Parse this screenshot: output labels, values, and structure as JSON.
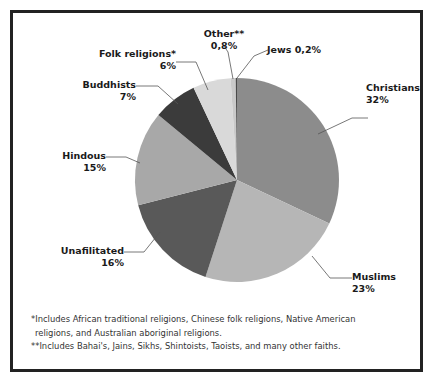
{
  "chart_data": {
    "type": "pie",
    "title": "",
    "subtitle": "",
    "xlabel": "",
    "ylabel": "",
    "legend_position": "none",
    "grid": false,
    "labels_outside": true,
    "start_angle_deg": 0,
    "direction": "clockwise",
    "categories": [
      "Christians",
      "Muslims",
      "Unafilitated",
      "Hindous",
      "Buddhists",
      "Folk religions*",
      "Other**",
      "Jews"
    ],
    "values": [
      32,
      23,
      16,
      15,
      7,
      6,
      0.8,
      0.2
    ],
    "value_labels": [
      "32%",
      "23%",
      "16%",
      "15%",
      "7%",
      "6%",
      "0,8%",
      "0,2%"
    ],
    "colors": [
      "#8c8c8c",
      "#b6b6b6",
      "#595959",
      "#a8a8a8",
      "#3b3b3b",
      "#d9d9d9",
      "#c9c9c9",
      "#4a4a4a"
    ],
    "slices": [
      {
        "name": "Christians",
        "value": 32,
        "value_label": "32%",
        "color": "#8c8c8c",
        "label_name": "Christians",
        "label_value": "32%"
      },
      {
        "name": "Muslims",
        "value": 23,
        "value_label": "23%",
        "color": "#b6b6b6",
        "label_name": "Muslims",
        "label_value": "23%"
      },
      {
        "name": "Unafilitated",
        "value": 16,
        "value_label": "16%",
        "color": "#595959",
        "label_name": "Unafilitated",
        "label_value": "16%"
      },
      {
        "name": "Hindous",
        "value": 15,
        "value_label": "15%",
        "color": "#a8a8a8",
        "label_name": "Hindous",
        "label_value": "15%"
      },
      {
        "name": "Buddhists",
        "value": 7,
        "value_label": "7%",
        "color": "#3b3b3b",
        "label_name": "Buddhists",
        "label_value": "7%"
      },
      {
        "name": "Folk religions*",
        "value": 6,
        "value_label": "6%",
        "color": "#d9d9d9",
        "label_name": "Folk religions*",
        "label_value": "6%"
      },
      {
        "name": "Other**",
        "value": 0.8,
        "value_label": "0,8%",
        "color": "#c9c9c9",
        "label_name": "Other**",
        "label_value": "0,8%"
      },
      {
        "name": "Jews",
        "value": 0.2,
        "value_label": "0,2%",
        "color": "#4a4a4a",
        "label_name": "Jews",
        "label_value": "0,2%"
      }
    ]
  },
  "labels": {
    "christians": {
      "name": "Christians",
      "value": "32%"
    },
    "muslims": {
      "name": "Muslims",
      "value": "23%"
    },
    "unafilitated": {
      "name": "Unafilitated",
      "value": "16%"
    },
    "hindous": {
      "name": "Hindous",
      "value": "15%"
    },
    "buddhists": {
      "name": "Buddhists",
      "value": "7%"
    },
    "folk": {
      "name": "Folk religions*",
      "value": "6%"
    },
    "other": {
      "name": "Other**",
      "value": "0,8%"
    },
    "jews": {
      "name": "Jews ",
      "value": "0,2%"
    }
  },
  "footnotes": {
    "line1": "*Includes African traditional religions, Chinese folk religions, Native American",
    "line2": "religions, and Australian aboriginal religions.",
    "line3": "**Includes Bahai's, Jains, Sikhs, Shintoists, Taoists, and many other faiths."
  }
}
